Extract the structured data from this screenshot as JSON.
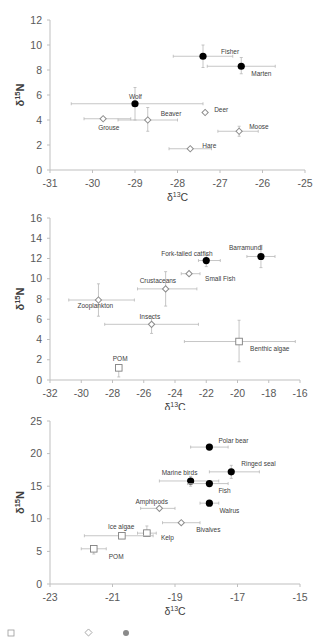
{
  "chart_data": [
    {
      "type": "scatter",
      "title": "",
      "xlabel": "δ13C",
      "ylabel": "δ15N",
      "xlim": [
        -31,
        -25
      ],
      "ylim": [
        0,
        12
      ],
      "xticks": [
        -31,
        -30,
        -29,
        -28,
        -27,
        -26,
        -25
      ],
      "yticks": [
        0,
        2,
        4,
        6,
        8,
        10,
        12
      ],
      "grid": false,
      "box": {
        "top": 20,
        "height": 150,
        "left": 50,
        "width": 255,
        "svg_top": 0,
        "svg_height": 205
      },
      "points": [
        {
          "label": "Fisher",
          "x": -27.4,
          "y": 9.1,
          "xerr": [
            -28.1,
            -26.7
          ],
          "yerr": [
            8.2,
            10.0
          ],
          "marker": "filled",
          "lx": 18,
          "ly": -2
        },
        {
          "label": "Marten",
          "x": -26.5,
          "y": 8.3,
          "xerr": [
            -27.3,
            -25.7
          ],
          "yerr": [
            7.7,
            9.0
          ],
          "marker": "filled",
          "lx": 10,
          "ly": 10
        },
        {
          "label": "Wolf",
          "x": -29.0,
          "y": 5.3,
          "xerr": [
            -30.5,
            -27.4
          ],
          "yerr": [
            4.0,
            6.6
          ],
          "marker": "filled",
          "lx": -6,
          "ly": -5
        },
        {
          "label": "Deer",
          "x": -27.35,
          "y": 4.6,
          "xerr": [
            -27.35,
            -27.35
          ],
          "yerr": [
            4.6,
            4.6
          ],
          "marker": "diamond",
          "lx": 9,
          "ly": -1
        },
        {
          "label": "Beaver",
          "x": -28.7,
          "y": 4.0,
          "xerr": [
            -29.4,
            -28.0
          ],
          "yerr": [
            3.1,
            5.0
          ],
          "marker": "diamond",
          "lx": 13,
          "ly": -4
        },
        {
          "label": "Grouse",
          "x": -29.75,
          "y": 4.1,
          "xerr": [
            -30.2,
            -29.1
          ],
          "yerr": [
            4.1,
            4.1
          ],
          "marker": "diamond",
          "lx": -5,
          "ly": 11
        },
        {
          "label": "Moose",
          "x": -26.55,
          "y": 3.1,
          "xerr": [
            -27.05,
            -26.1
          ],
          "yerr": [
            2.7,
            3.5
          ],
          "marker": "diamond",
          "lx": 10,
          "ly": -2
        },
        {
          "label": "Hare",
          "x": -27.7,
          "y": 1.7,
          "xerr": [
            -28.2,
            -27.2
          ],
          "yerr": [
            1.7,
            1.7
          ],
          "marker": "diamond",
          "lx": 12,
          "ly": -1
        }
      ]
    },
    {
      "type": "scatter",
      "title": "",
      "xlabel": "δ13C",
      "ylabel": "δ15N",
      "xlim": [
        -32,
        -16
      ],
      "ylim": [
        0,
        16
      ],
      "xticks": [
        -32,
        -30,
        -28,
        -26,
        -24,
        -22,
        -20,
        -18,
        -16
      ],
      "yticks": [
        0,
        2,
        4,
        6,
        8,
        10,
        12,
        14,
        16
      ],
      "grid": false,
      "box": {
        "top": 218,
        "height": 162,
        "left": 50,
        "width": 250,
        "svg_top": 0,
        "svg_height": 410
      },
      "points": [
        {
          "label": "Barramundi",
          "x": -18.5,
          "y": 12.2,
          "xerr": [
            -19.4,
            -17.6
          ],
          "yerr": [
            11.1,
            13.3
          ],
          "marker": "filled",
          "lx": -32,
          "ly": -6
        },
        {
          "label": "Fork-tailed catfish",
          "x": -22.0,
          "y": 11.8,
          "xerr": [
            -22.5,
            -21.1
          ],
          "yerr": [
            11.2,
            12.4
          ],
          "marker": "filled",
          "lx": -45,
          "ly": -5
        },
        {
          "label": "Small Fish",
          "x": -23.1,
          "y": 10.5,
          "xerr": [
            -23.6,
            -22.4
          ],
          "yerr": [
            10.5,
            10.5
          ],
          "marker": "diamond",
          "lx": 16,
          "ly": 7
        },
        {
          "label": "Crustaceans",
          "x": -24.6,
          "y": 9.0,
          "xerr": [
            -26.4,
            -22.6
          ],
          "yerr": [
            7.3,
            10.7
          ],
          "marker": "diamond",
          "lx": -26,
          "ly": -6
        },
        {
          "label": "Zooplankton",
          "x": -28.9,
          "y": 7.9,
          "xerr": [
            -30.8,
            -26.6
          ],
          "yerr": [
            6.3,
            9.5
          ],
          "marker": "diamond",
          "lx": -21,
          "ly": 8
        },
        {
          "label": "Insects",
          "x": -25.5,
          "y": 5.5,
          "xerr": [
            -28.5,
            -22.5
          ],
          "yerr": [
            4.6,
            6.2
          ],
          "marker": "diamond",
          "lx": -12,
          "ly": -5
        },
        {
          "label": "Benthic algae",
          "x": -19.9,
          "y": 3.8,
          "xerr": [
            -23.4,
            -16.3
          ],
          "yerr": [
            1.8,
            5.9
          ],
          "marker": "square",
          "lx": 11,
          "ly": 9
        },
        {
          "label": "POM",
          "x": -27.6,
          "y": 1.2,
          "xerr": [
            -27.6,
            -27.6
          ],
          "yerr": [
            0.3,
            1.2
          ],
          "marker": "square",
          "lx": -6,
          "ly": -7
        }
      ]
    },
    {
      "type": "scatter",
      "title": "",
      "xlabel": "δ13C",
      "ylabel": "δ15N",
      "xlim": [
        -23,
        -15
      ],
      "ylim": [
        0,
        25
      ],
      "xticks": [
        -23,
        -21,
        -19,
        -17,
        -15
      ],
      "yticks": [
        0,
        5,
        10,
        15,
        20,
        25
      ],
      "grid": false,
      "box": {
        "top": 421,
        "height": 163,
        "left": 50,
        "width": 250,
        "svg_top": 0,
        "svg_height": 637
      },
      "points": [
        {
          "label": "Polar bear",
          "x": -17.9,
          "y": 21.0,
          "xerr": [
            -18.5,
            -17.3
          ],
          "yerr": [
            21.0,
            21.0
          ],
          "marker": "filled",
          "lx": 9,
          "ly": -4
        },
        {
          "label": "Ringed seal",
          "x": -17.2,
          "y": 17.2,
          "xerr": [
            -17.9,
            -16.3
          ],
          "yerr": [
            16.2,
            18.2
          ],
          "marker": "filled",
          "lx": 10,
          "ly": -6
        },
        {
          "label": "Marine birds",
          "x": -18.5,
          "y": 15.8,
          "xerr": [
            -19.5,
            -17.6
          ],
          "yerr": [
            15.0,
            16.5
          ],
          "marker": "filled",
          "lx": -29,
          "ly": -6
        },
        {
          "label": "Fish",
          "x": -17.9,
          "y": 15.4,
          "xerr": [
            -18.6,
            -17.3
          ],
          "yerr": [
            15.4,
            15.4
          ],
          "marker": "filled",
          "lx": 9,
          "ly": 9
        },
        {
          "label": "Walrus",
          "x": -17.9,
          "y": 12.4,
          "xerr": [
            -18.2,
            -17.6
          ],
          "yerr": [
            12.4,
            12.4
          ],
          "marker": "filled",
          "lx": 10,
          "ly": 10
        },
        {
          "label": "Amphipods",
          "x": -19.5,
          "y": 11.6,
          "xerr": [
            -20.1,
            -19.0
          ],
          "yerr": [
            11.6,
            11.6
          ],
          "marker": "diamond",
          "lx": -24,
          "ly": -4
        },
        {
          "label": "Bivalves",
          "x": -18.8,
          "y": 9.4,
          "xerr": [
            -19.4,
            -18.2
          ],
          "yerr": [
            9.4,
            9.4
          ],
          "marker": "diamond",
          "lx": 15,
          "ly": 9
        },
        {
          "label": "Kelp",
          "x": -19.9,
          "y": 7.8,
          "xerr": [
            -20.2,
            -19.6
          ],
          "yerr": [
            7.4,
            8.9
          ],
          "marker": "square",
          "lx": 14,
          "ly": 7
        },
        {
          "label": "Ice algae",
          "x": -20.7,
          "y": 7.4,
          "xerr": [
            -21.9,
            -19.7
          ],
          "yerr": [
            7.4,
            7.4
          ],
          "marker": "square",
          "lx": -14,
          "ly": -7
        },
        {
          "label": "POM",
          "x": -21.6,
          "y": 5.4,
          "xerr": [
            -22.0,
            -21.2
          ],
          "yerr": [
            4.6,
            5.6
          ],
          "marker": "square",
          "lx": 15,
          "ly": 10
        }
      ]
    }
  ]
}
